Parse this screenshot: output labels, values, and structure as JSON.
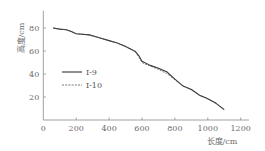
{
  "chart_data": {
    "type": "line",
    "title": "",
    "xlabel": "长度/cm",
    "ylabel": "高度/cm",
    "xlim": [
      0,
      1250
    ],
    "ylim": [
      0,
      95
    ],
    "xticks": [
      0,
      200,
      400,
      600,
      800,
      1000,
      1200
    ],
    "yticks": [
      20,
      40,
      60,
      80
    ],
    "xtick_labels": [
      "0",
      "200",
      "400",
      "600",
      "800",
      "1000",
      "1200"
    ],
    "ytick_labels": [
      "20",
      "40",
      "60",
      "80"
    ],
    "grid": false,
    "legend_position": "center-left",
    "series": [
      {
        "name": "Ⅰ-9",
        "style": "solid",
        "color": "#333333",
        "x": [
          60,
          100,
          140,
          170,
          200,
          280,
          340,
          400,
          450,
          500,
          560,
          580,
          600,
          650,
          700,
          750,
          800,
          850,
          900,
          950,
          1000,
          1050,
          1100
        ],
        "y": [
          80,
          79,
          78.5,
          77,
          75,
          74,
          71.5,
          69,
          67,
          64,
          59.5,
          56,
          51,
          47.5,
          45,
          42,
          35.5,
          29.5,
          26.5,
          21.5,
          18.5,
          14.5,
          9
        ]
      },
      {
        "name": "Ⅰ-10",
        "style": "dashed",
        "color": "#555555",
        "x": [
          60,
          100,
          140,
          170,
          200,
          280,
          340,
          400,
          450,
          500,
          560,
          580,
          600,
          620,
          650,
          700,
          750,
          800,
          850,
          900,
          950,
          1000,
          1050,
          1100
        ],
        "y": [
          80,
          79,
          78.5,
          77,
          75,
          74,
          71.5,
          69,
          67,
          64,
          59.5,
          55,
          50,
          48.5,
          47,
          44,
          40.5,
          35,
          29.5,
          26.5,
          21.5,
          18.5,
          14.5,
          9
        ]
      }
    ]
  }
}
